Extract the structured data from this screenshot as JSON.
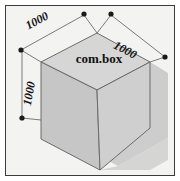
{
  "figure": {
    "title": "com.box",
    "background_color": "#f3f3f1",
    "frame_color": "#3c3c3c",
    "shadow_color": "#c9c9c9"
  },
  "box": {
    "label": "com.box",
    "top_face_color": "#d6d6d6",
    "left_face_color": "#c6c6c6",
    "right_face_color": "#cfcfcf",
    "edge_color": "#6b6b6b"
  },
  "dimensions": [
    {
      "name": "top-left-edge",
      "value": "1000"
    },
    {
      "name": "top-right-edge",
      "value": "1000"
    },
    {
      "name": "vertical-edge",
      "value": "1000"
    }
  ],
  "markers": {
    "color": "#1a1a1a",
    "count": 5
  }
}
